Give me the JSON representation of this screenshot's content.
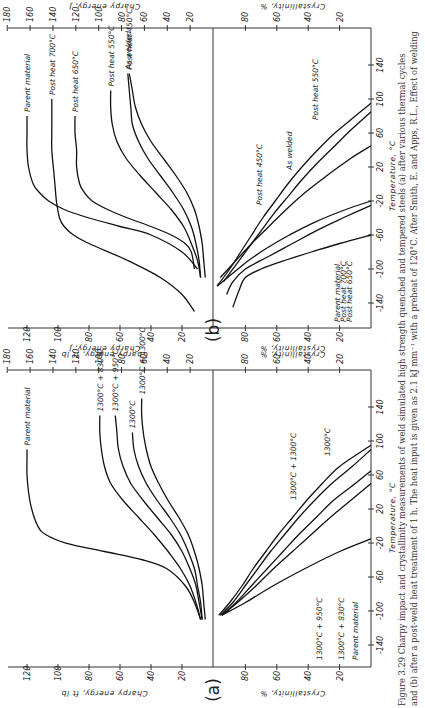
{
  "figure": {
    "caption_lines": [
      "Figure 3.29  Charpy impact and crystallinity measurements of weld simulated high strength quenched and tempered steels (a) after various thermal cycles",
      "and (b) after a post-weld heat treatment of 1 h. The heat input is given as 2.1 kJ mm⁻¹ with a preheat of 120°C. After Smith, E. and Apps, R.L., Effect of welding"
    ],
    "orientation": "rotated 90 degrees counter-clockwise on page"
  },
  "chart_data": [
    {
      "panel": "(a)",
      "type": "line",
      "title": "Charpy energy vs temperature after various thermal cycles",
      "xlabel": "Temperature, °C",
      "ylabel": "Charpy energy, ft lb",
      "ylabel_secondary": "Charpy energy, J",
      "x_ticks": [
        -140,
        -100,
        -60,
        -20,
        20,
        60,
        100,
        140
      ],
      "y_ticks": [
        20,
        40,
        60,
        80,
        100,
        120
      ],
      "y2_ticks": [
        20,
        40,
        60,
        80,
        100,
        120,
        140,
        160,
        180
      ],
      "xlim": [
        -170,
        180
      ],
      "ylim": [
        0,
        130
      ],
      "series": [
        {
          "name": "Parent material",
          "x": [
            -110,
            -90,
            -70,
            -50,
            -40,
            -30,
            -20,
            -10,
            0,
            20,
            40,
            60,
            80,
            90
          ],
          "values": [
            8,
            12,
            18,
            30,
            45,
            70,
            95,
            108,
            113,
            117,
            119,
            120,
            120,
            120
          ]
        },
        {
          "name": "1300°C + 830°C",
          "x": [
            -110,
            -90,
            -70,
            -50,
            -30,
            -10,
            10,
            30,
            50,
            70,
            90,
            110,
            130
          ],
          "values": [
            8,
            11,
            15,
            21,
            29,
            38,
            48,
            58,
            66,
            70,
            72,
            73,
            73
          ]
        },
        {
          "name": "1300°C + 950°C",
          "x": [
            -110,
            -90,
            -70,
            -50,
            -30,
            -10,
            10,
            30,
            50,
            70,
            90,
            110,
            130
          ],
          "values": [
            7,
            9,
            11,
            15,
            20,
            27,
            36,
            45,
            53,
            58,
            61,
            62,
            63
          ]
        },
        {
          "name": "1300°C",
          "x": [
            -110,
            -90,
            -70,
            -50,
            -30,
            -10,
            10,
            30,
            50,
            70,
            90,
            110
          ],
          "values": [
            7,
            8,
            10,
            12,
            16,
            21,
            28,
            36,
            43,
            48,
            51,
            52
          ]
        },
        {
          "name": "1300°C + 1300°C",
          "x": [
            -110,
            -90,
            -70,
            -50,
            -30,
            -10,
            10,
            30,
            50,
            70,
            90,
            110,
            130,
            150
          ],
          "values": [
            5,
            6,
            7,
            9,
            12,
            16,
            22,
            29,
            35,
            40,
            43,
            45,
            46,
            46
          ]
        }
      ]
    },
    {
      "panel": "(a)",
      "type": "line",
      "title": "Crystallinity vs temperature after various thermal cycles",
      "xlabel": "Temperature, °C",
      "ylabel": "Crystallinity, %",
      "x_ticks": [
        -140,
        -100,
        -60,
        -20,
        20,
        60,
        100,
        140
      ],
      "y_ticks": [
        20,
        40,
        60,
        80
      ],
      "xlim": [
        -170,
        180
      ],
      "ylim": [
        0,
        100
      ],
      "series": [
        {
          "name": "Parent material",
          "x": [
            -105,
            -90,
            -70,
            -50,
            -30,
            -15
          ],
          "values": [
            95,
            80,
            62,
            42,
            20,
            0
          ]
        },
        {
          "name": "1300°C + 830°C",
          "x": [
            -105,
            -90,
            -70,
            -50,
            -30,
            -10,
            10,
            30,
            50
          ],
          "values": [
            95,
            85,
            73,
            62,
            50,
            38,
            26,
            13,
            0
          ]
        },
        {
          "name": "1300°C + 950°C",
          "x": [
            -105,
            -90,
            -70,
            -50,
            -30,
            -10,
            10,
            30,
            50,
            65
          ],
          "values": [
            95,
            86,
            76,
            66,
            56,
            46,
            35,
            24,
            10,
            0
          ]
        },
        {
          "name": "1300°C",
          "x": [
            -105,
            -90,
            -70,
            -50,
            -30,
            -10,
            10,
            30,
            50,
            70,
            90
          ],
          "values": [
            96,
            88,
            80,
            72,
            64,
            55,
            46,
            36,
            25,
            12,
            0
          ]
        },
        {
          "name": "1300°C + 1300°C",
          "x": [
            -105,
            -90,
            -70,
            -50,
            -30,
            -10,
            10,
            30,
            50,
            70,
            95
          ],
          "values": [
            97,
            90,
            82,
            75,
            67,
            59,
            50,
            41,
            31,
            20,
            0
          ]
        }
      ]
    },
    {
      "panel": "(b)",
      "type": "line",
      "title": "Charpy energy vs temperature after 1 h post-weld heat treatment",
      "xlabel": "Temperature, °C",
      "ylabel": "Charpy energy, ft lb",
      "ylabel_secondary": "Charpy energy, J",
      "x_ticks": [
        -140,
        -100,
        -60,
        -20,
        20,
        60,
        100,
        140
      ],
      "y_ticks": [
        20,
        40,
        60,
        80,
        100,
        120
      ],
      "y2_ticks": [
        20,
        40,
        60,
        80,
        100,
        120,
        140,
        160,
        180
      ],
      "xlim": [
        -170,
        180
      ],
      "ylim": [
        0,
        130
      ],
      "series": [
        {
          "name": "Parent material",
          "x": [
            -100,
            -80,
            -60,
            -50,
            -40,
            -30,
            -20,
            -10,
            0,
            20,
            40,
            60,
            80
          ],
          "values": [
            10,
            20,
            40,
            60,
            80,
            96,
            106,
            112,
            116,
            119,
            120,
            120,
            120
          ]
        },
        {
          "name": "Post heat 700°C",
          "x": [
            -150,
            -130,
            -110,
            -90,
            -70,
            -60,
            -50,
            -40,
            -20,
            0,
            20,
            40,
            60,
            80,
            100
          ],
          "values": [
            12,
            20,
            34,
            55,
            80,
            90,
            96,
            99,
            101,
            102,
            103,
            104,
            104,
            104,
            104
          ]
        },
        {
          "name": "Post heat 650°C",
          "x": [
            -100,
            -80,
            -70,
            -60,
            -50,
            -40,
            -30,
            -20,
            -10,
            0,
            20,
            40,
            60,
            80
          ],
          "values": [
            12,
            14,
            18,
            27,
            40,
            55,
            68,
            78,
            83,
            86,
            88,
            88,
            89,
            89
          ]
        },
        {
          "name": "Post heat 550°C",
          "x": [
            -110,
            -90,
            -70,
            -50,
            -30,
            -10,
            10,
            30,
            50,
            70,
            90,
            110
          ],
          "values": [
            8,
            10,
            14,
            19,
            27,
            37,
            47,
            56,
            62,
            65,
            66,
            66
          ]
        },
        {
          "name": "As welded",
          "x": [
            -110,
            -90,
            -70,
            -50,
            -30,
            -10,
            10,
            30,
            50,
            70,
            90,
            110,
            130
          ],
          "values": [
            8,
            9,
            11,
            14,
            19,
            26,
            34,
            42,
            48,
            52,
            53,
            54,
            55
          ]
        },
        {
          "name": "Post heat 450°C",
          "x": [
            -110,
            -90,
            -70,
            -50,
            -30,
            -10,
            10,
            30,
            50,
            70,
            90,
            110,
            130
          ],
          "values": [
            5,
            6,
            7,
            9,
            12,
            17,
            24,
            32,
            40,
            46,
            50,
            52,
            54
          ]
        }
      ]
    },
    {
      "panel": "(b)",
      "type": "line",
      "title": "Crystallinity vs temperature after 1 h post-weld heat treatment",
      "xlabel": "Temperature, °C",
      "ylabel": "Crystallinity, %",
      "x_ticks": [
        -140,
        -100,
        -60,
        -20,
        20,
        60,
        100,
        140
      ],
      "y_ticks": [
        20,
        40,
        60,
        80
      ],
      "xlim": [
        -170,
        180
      ],
      "ylim": [
        0,
        100
      ],
      "series": [
        {
          "name": "Post heat 700°C",
          "x": [
            -145,
            -125,
            -110,
            -100,
            -90,
            -80,
            -70,
            -60
          ],
          "values": [
            88,
            84,
            80,
            70,
            55,
            38,
            20,
            0
          ]
        },
        {
          "name": "Parent material",
          "x": [
            -130,
            -115,
            -100,
            -85,
            -70,
            -55,
            -40,
            -25
          ],
          "values": [
            92,
            88,
            80,
            65,
            50,
            35,
            18,
            0
          ]
        },
        {
          "name": "Post heat 650°C",
          "x": [
            -120,
            -105,
            -90,
            -75,
            -60,
            -45,
            -30,
            -20
          ],
          "values": [
            98,
            88,
            78,
            66,
            52,
            36,
            16,
            0
          ]
        },
        {
          "name": "Post heat 550°C",
          "x": [
            -110,
            -90,
            -70,
            -50,
            -30,
            -10,
            10,
            30,
            45
          ],
          "values": [
            96,
            86,
            76,
            65,
            54,
            42,
            28,
            13,
            0
          ]
        },
        {
          "name": "As welded",
          "x": [
            -115,
            -95,
            -75,
            -55,
            -35,
            -15,
            5,
            25,
            45,
            65,
            85
          ],
          "values": [
            94,
            86,
            78,
            70,
            62,
            53,
            44,
            34,
            23,
            12,
            0
          ]
        },
        {
          "name": "Post heat 450°C",
          "x": [
            -120,
            -100,
            -80,
            -60,
            -40,
            -20,
            0,
            20,
            40,
            60,
            80,
            95
          ],
          "values": [
            98,
            90,
            83,
            76,
            69,
            61,
            53,
            44,
            34,
            23,
            10,
            0
          ]
        }
      ]
    }
  ],
  "labels": {
    "panel_a": "(a)",
    "panel_b": "(b)",
    "energy_ftlb": "Charpy energy, ft lb",
    "energy_j": "Charpy energy, J",
    "crystallinity": "Crystallinity, %",
    "temperature": "Temperature, °C"
  }
}
